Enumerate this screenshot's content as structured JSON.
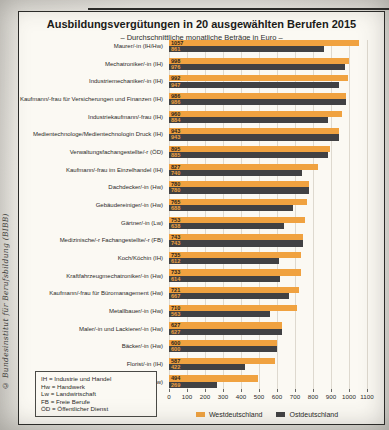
{
  "page": {
    "copyright_sidebar": "© Bundesinstitut für Berufsbildung (BIBB)"
  },
  "chart_data": {
    "type": "bar",
    "orientation": "horizontal",
    "title": "Ausbildungsvergütungen in 20 ausgewählten Berufen 2015",
    "subtitle": "– Durchschnittliche monatliche Beträge in Euro –",
    "xlim": [
      0,
      1100
    ],
    "x_ticks": [
      0,
      100,
      200,
      300,
      400,
      500,
      600,
      700,
      800,
      900,
      1000,
      1100
    ],
    "grid": true,
    "legend_position": "bottom",
    "categories": [
      "Maurer/-in (IH/Hw)",
      "Mechatroniker/-in (IH)",
      "Industriemechaniker/-in (IH)",
      "Kaufmann/-frau für Versicherungen und Finanzen (IH)",
      "Industriekaufmann/-frau (IH)",
      "Medientechnologe/Medientechnologin Druck (IH)",
      "Verwaltungsfachangestellte/-r (ÖD)",
      "Kaufmann/-frau im Einzelhandel (IH)",
      "Dachdecker/-in (Hw)",
      "Gebäudereiniger/-in (Hw)",
      "Gärtner/-in (Lw)",
      "Medizinische/-r Fachangestellte/-r (FB)",
      "Koch/Köchin (IH)",
      "Kraftfahrzeugmechatroniker/-in (Hw)",
      "Kaufmann/-frau für Büromanagement (Hw)",
      "Metallbauer/-in (Hw)",
      "Maler/-in und Lackierer/-in (Hw)",
      "Bäcker/-in (Hw)",
      "Florist/-in (IH)",
      "Friseur/-in (Hw)"
    ],
    "series": [
      {
        "name": "Westdeutschland",
        "color": "#f0a240",
        "value_text_color": "#2b2218",
        "values": [
          1057,
          998,
          992,
          986,
          960,
          943,
          895,
          827,
          780,
          765,
          753,
          743,
          735,
          733,
          721,
          710,
          627,
          600,
          587,
          494
        ]
      },
      {
        "name": "Ostdeutschland",
        "color": "#414143",
        "value_text_color": "#f0a240",
        "values": [
          861,
          976,
          947,
          986,
          884,
          943,
          885,
          740,
          780,
          688,
          638,
          743,
          612,
          614,
          667,
          563,
          627,
          600,
          422,
          269
        ]
      }
    ],
    "abbreviations": [
      "IH = Industrie und Handel",
      "Hw = Handwerk",
      "Lw = Landwirtschaft",
      "FB = Freie Berufe",
      "ÖD = Öffentlicher Dienst"
    ]
  }
}
